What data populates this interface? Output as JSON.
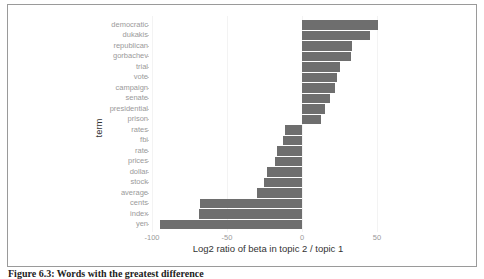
{
  "chart_data": {
    "type": "bar",
    "orientation": "horizontal",
    "title": "",
    "xlabel": "Log2 ratio of beta in topic 2 / topic 1",
    "ylabel": "term",
    "xlim": [
      -100,
      57
    ],
    "xticks": [
      -100,
      -50,
      0,
      50
    ],
    "xtick_labels": [
      "-100",
      "-50",
      "0",
      "50"
    ],
    "grid": false,
    "legend": "none",
    "bar_color": "#6e6e6e",
    "categories": [
      "democratic",
      "dukakis",
      "republican",
      "gorbachev",
      "trial",
      "vote",
      "campaign",
      "senate",
      "presidential",
      "prison",
      "rates",
      "fbi",
      "rate",
      "prices",
      "dollar",
      "stock",
      "average",
      "cents",
      "index",
      "yen"
    ],
    "values": [
      50.5,
      45,
      33,
      32.5,
      25,
      23.5,
      22,
      18.5,
      15,
      12.5,
      -11.5,
      -13,
      -17,
      -18,
      -23.5,
      -25.5,
      -30,
      -68,
      -69,
      -95
    ]
  },
  "caption": "Figure 6.3: Words with the greatest difference"
}
